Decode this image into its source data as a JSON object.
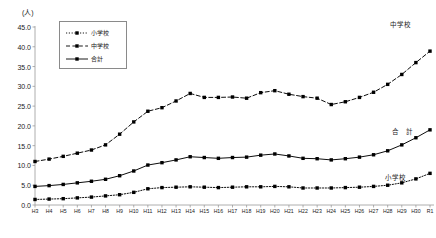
{
  "chart_data": {
    "type": "line",
    "title": "",
    "xlabel": "",
    "ylabel": "(人)",
    "ylim": [
      0.0,
      45.0
    ],
    "ytick_step": 5.0,
    "ytick_labels": [
      "45.0",
      "40.0",
      "35.0",
      "30.0",
      "25.0",
      "20.0",
      "15.0",
      "10.0",
      "5.0",
      "0.0"
    ],
    "ytick_values": [
      45.0,
      40.0,
      35.0,
      30.0,
      25.0,
      20.0,
      15.0,
      10.0,
      5.0,
      0.0
    ],
    "grid": false,
    "legend_position": "top-left",
    "categories": [
      "H3",
      "H4",
      "H5",
      "H6",
      "H7",
      "H8",
      "H9",
      "H10",
      "H11",
      "H12",
      "H13",
      "H14",
      "H15",
      "H16",
      "H17",
      "H18",
      "H19",
      "H20",
      "H21",
      "H22",
      "H23",
      "H24",
      "H25",
      "H26",
      "H27",
      "H28",
      "H29",
      "H30",
      "R1"
    ],
    "series": [
      {
        "name": "小学校",
        "line_style": "dotted",
        "marker": "square",
        "color": "#000000",
        "values": [
          1.4,
          1.5,
          1.6,
          1.8,
          2.0,
          2.3,
          2.6,
          3.2,
          4.1,
          4.4,
          4.5,
          4.6,
          4.5,
          4.4,
          4.5,
          4.6,
          4.6,
          4.7,
          4.6,
          4.3,
          4.3,
          4.3,
          4.4,
          4.5,
          4.7,
          5.0,
          5.6,
          6.6,
          8.0
        ]
      },
      {
        "name": "中学校",
        "line_style": "dashed",
        "marker": "square",
        "color": "#000000",
        "values": [
          11.0,
          11.6,
          12.3,
          13.1,
          13.9,
          15.2,
          17.9,
          21.0,
          23.7,
          24.6,
          26.3,
          28.2,
          27.2,
          27.2,
          27.3,
          27.0,
          28.4,
          28.9,
          28.0,
          27.4,
          27.0,
          25.4,
          26.1,
          27.2,
          28.5,
          30.5,
          33.0,
          36.0,
          38.9
        ]
      },
      {
        "name": "合計",
        "line_style": "solid",
        "marker": "square",
        "color": "#000000",
        "values": [
          4.7,
          4.9,
          5.2,
          5.6,
          6.0,
          6.5,
          7.4,
          8.6,
          10.1,
          10.7,
          11.4,
          12.2,
          12.0,
          11.8,
          12.0,
          12.1,
          12.6,
          12.9,
          12.4,
          11.8,
          11.7,
          11.4,
          11.7,
          12.1,
          12.7,
          13.7,
          15.2,
          17.0,
          19.0
        ]
      }
    ]
  },
  "legend": {
    "items": [
      {
        "label": "小学校"
      },
      {
        "label": "中学校"
      },
      {
        "label": "合計"
      }
    ]
  },
  "annotations": [
    {
      "id": "chugakko",
      "label": "中学校"
    },
    {
      "id": "goukei",
      "label": "合　計"
    },
    {
      "id": "shougakko",
      "label": "小学校"
    }
  ]
}
